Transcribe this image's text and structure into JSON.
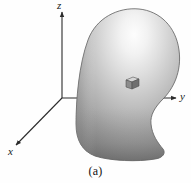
{
  "figure": {
    "caption": "(a)",
    "background_color": "#fefefe",
    "width": 191,
    "height": 183
  },
  "axes": {
    "origin": {
      "x": 62,
      "y": 98
    },
    "stroke_color": "#2b2b2b",
    "items": [
      {
        "name": "z-axis",
        "label": "z",
        "direction": "up",
        "tip": {
          "x": 62,
          "y": 10
        },
        "label_position": {
          "x": 57,
          "y": 0
        }
      },
      {
        "name": "y-axis",
        "label": "y",
        "direction": "right",
        "tip": {
          "x": 178,
          "y": 98
        },
        "label_position": {
          "x": 180,
          "y": 91
        }
      },
      {
        "name": "x-axis",
        "label": "x",
        "direction": "down-left",
        "tip": {
          "x": 13,
          "y": 148
        },
        "label_position": {
          "x": 8,
          "y": 146
        }
      }
    ]
  },
  "blob": {
    "name": "shaded-volume-body",
    "description": "kidney-bean shaped shaded 3D volume",
    "fill_light": "#fdfdfd",
    "fill_mid": "#b8b8b8",
    "fill_dark": "#6e6e6e",
    "outline_color": "#5a5a5a",
    "highlight_center": {
      "x": 128,
      "y": 34
    },
    "bounds": {
      "left": 76,
      "top": 8,
      "right": 179,
      "bottom": 161
    }
  },
  "volume_element": {
    "name": "differential-volume-cube",
    "description": "small shaded cube marking a differential volume element inside the body",
    "position": {
      "x": 126,
      "y": 77
    },
    "size": 11,
    "top_face_color": "#d8d8d8",
    "front_face_color": "#7d7d7d",
    "side_face_color": "#a8a8a8",
    "edge_color": "#4a4a4a"
  }
}
